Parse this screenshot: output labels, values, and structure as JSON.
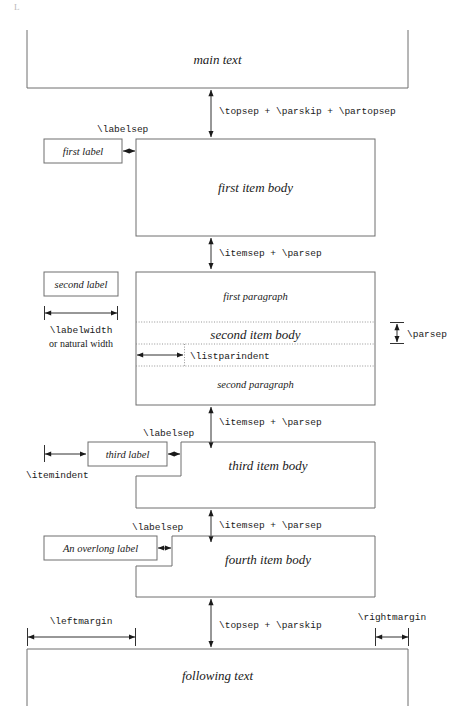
{
  "figure": {
    "corner_mark": "L",
    "kind": "latex-list-layout-diagram"
  },
  "boxes": {
    "main_text": "main text",
    "first_item_body": "first item body",
    "second_item_body": "second item body",
    "third_item_body": "third item body",
    "fourth_item_body": "fourth item body",
    "following_text": "following text"
  },
  "paragraphs": {
    "first": "first paragraph",
    "second": "second paragraph"
  },
  "labels": {
    "first": "first label",
    "second": "second label",
    "third": "third label",
    "fourth": "An overlong label"
  },
  "annotations": {
    "topsep_parskip_partopsep": "\\topsep + \\parskip + \\partopsep",
    "labelsep_1": "\\labelsep",
    "itemsep_parsep_1": "\\itemsep + \\parsep",
    "labelwidth": "\\labelwidth",
    "labelwidth_alt": "or natural width",
    "parsep": "\\parsep",
    "listparindent": "\\listparindent",
    "itemsep_parsep_2": "\\itemsep + \\parsep",
    "labelsep_2": "\\labelsep",
    "itemindent": "\\itemindent",
    "itemsep_parsep_3": "\\itemsep + \\parsep",
    "labelsep_3": "\\labelsep",
    "leftmargin": "\\leftmargin",
    "topsep_parskip": "\\topsep + \\parskip",
    "rightmargin": "\\rightmargin"
  },
  "colors": {
    "ink": "#1a1a1a",
    "rule": "#6e6e6e",
    "dotted": "#8a8a8a",
    "page": "#ffffff"
  }
}
